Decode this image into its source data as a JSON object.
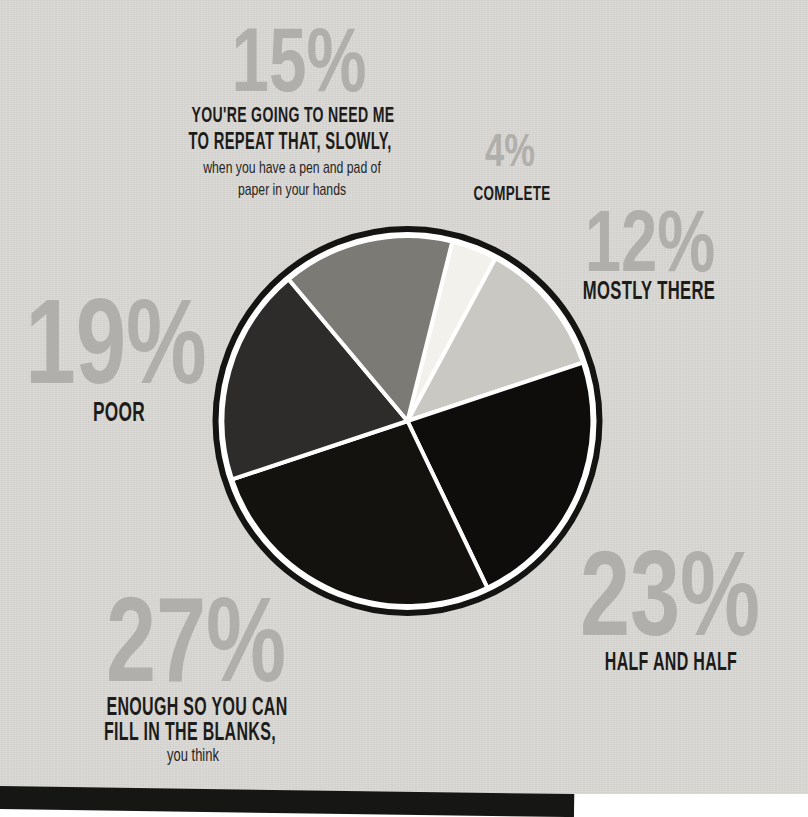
{
  "chart_data": {
    "type": "pie",
    "unit": "%",
    "start_angle_clockwise_from_top_deg": 14,
    "slices": [
      {
        "label": "COMPLETE",
        "value": 4,
        "color": "#f2f1ec"
      },
      {
        "label": "MOSTLY THERE",
        "value": 12,
        "color": "#c9c8c3"
      },
      {
        "label": "HALF AND HALF",
        "value": 23,
        "color": "#0e0d0b"
      },
      {
        "label": "ENOUGH SO YOU CAN FILL IN THE BLANKS, you think",
        "value": 27,
        "color": "#13120f"
      },
      {
        "label": "POOR",
        "value": 19,
        "color": "#2d2c2a"
      },
      {
        "label": "YOU'RE GOING TO NEED ME TO REPEAT THAT, SLOWLY, when you have a pen and pad of paper in your hands",
        "value": 15,
        "color": "#7b7a75"
      }
    ],
    "divider_color": "#ffffff",
    "outer_ring_color": "#141412",
    "background_color": "#d9d8d4",
    "value_label_color": "#b0afab",
    "category_label_color": "#1d1c1a",
    "legend_position": "around"
  },
  "callouts": {
    "repeat_that": {
      "value": "15%",
      "label_line1": "YOU'RE GOING TO NEED ME",
      "label_line2": "TO REPEAT THAT, SLOWLY,",
      "sublabel_line1": "when you have a pen and pad of",
      "sublabel_line2": "paper in your hands"
    },
    "complete": {
      "value": "4%",
      "label": "COMPLETE"
    },
    "mostly_there": {
      "value": "12%",
      "label": "MOSTLY THERE"
    },
    "poor": {
      "value": "19%",
      "label": "POOR"
    },
    "half_and_half": {
      "value": "23%",
      "label": "HALF AND HALF"
    },
    "fill_in_blanks": {
      "value": "27%",
      "label_line1": "ENOUGH SO YOU CAN",
      "label_line2": "FILL IN THE BLANKS,",
      "sublabel": "you think"
    }
  }
}
